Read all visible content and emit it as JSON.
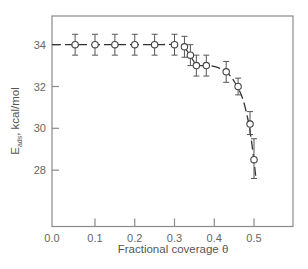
{
  "chart_data": {
    "type": "scatter",
    "title": "",
    "xlabel": "Fractional coverage θ",
    "ylabel_main": "E",
    "ylabel_sub": "ads",
    "ylabel_unit": ", kcal/mol",
    "ylabel": "E_ads, kcal/mol",
    "xlim": [
      0.0,
      0.6
    ],
    "ylim": [
      25.3,
      35.4
    ],
    "grid": false,
    "legend": null,
    "x_ticks": [
      0.0,
      0.1,
      0.2,
      0.3,
      0.4,
      0.5
    ],
    "x_tick_labels": [
      "0.0",
      "0.1",
      "0.2",
      "0.3",
      "0.4",
      "0.5"
    ],
    "y_ticks": [
      28,
      30,
      32,
      34
    ],
    "y_tick_labels": [
      "28",
      "30",
      "32",
      "34"
    ],
    "series": [
      {
        "name": "Measured E_ads",
        "marker": "open-circle",
        "error_bars": true,
        "points": [
          {
            "x": 0.05,
            "y": 34.0,
            "err_low": 33.5,
            "err_high": 34.5
          },
          {
            "x": 0.1,
            "y": 34.0,
            "err_low": 33.5,
            "err_high": 34.5
          },
          {
            "x": 0.15,
            "y": 34.0,
            "err_low": 33.5,
            "err_high": 34.5
          },
          {
            "x": 0.2,
            "y": 34.0,
            "err_low": 33.5,
            "err_high": 34.5
          },
          {
            "x": 0.25,
            "y": 34.0,
            "err_low": 33.5,
            "err_high": 34.5
          },
          {
            "x": 0.3,
            "y": 34.0,
            "err_low": 33.5,
            "err_high": 34.5
          },
          {
            "x": 0.325,
            "y": 33.9,
            "err_low": 33.4,
            "err_high": 34.4
          },
          {
            "x": 0.34,
            "y": 33.5,
            "err_low": 33.0,
            "err_high": 34.0
          },
          {
            "x": 0.355,
            "y": 33.0,
            "err_low": 32.5,
            "err_high": 33.5
          },
          {
            "x": 0.38,
            "y": 33.0,
            "err_low": 32.5,
            "err_high": 33.5
          },
          {
            "x": 0.43,
            "y": 32.7,
            "err_low": 32.2,
            "err_high": 33.2
          },
          {
            "x": 0.46,
            "y": 32.0,
            "err_low": 31.6,
            "err_high": 32.4
          },
          {
            "x": 0.49,
            "y": 30.2,
            "err_low": 29.7,
            "err_high": 30.8
          },
          {
            "x": 0.5,
            "y": 28.5,
            "err_low": 27.6,
            "err_high": 29.5
          }
        ]
      },
      {
        "name": "Fitted curve",
        "style": "dashed",
        "x": [
          0.0,
          0.05,
          0.1,
          0.15,
          0.2,
          0.25,
          0.3,
          0.325,
          0.34,
          0.355,
          0.37,
          0.39,
          0.41,
          0.43,
          0.45,
          0.47,
          0.485,
          0.495,
          0.505
        ],
        "y": [
          34.0,
          34.0,
          34.0,
          34.0,
          34.0,
          34.0,
          34.0,
          33.85,
          33.45,
          33.05,
          33.0,
          33.0,
          32.9,
          32.7,
          32.25,
          31.5,
          30.4,
          29.2,
          27.6
        ]
      }
    ]
  }
}
